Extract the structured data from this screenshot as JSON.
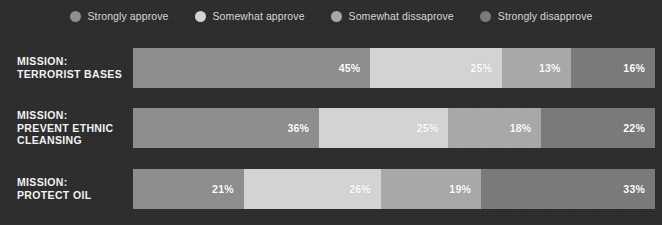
{
  "legend": {
    "items": [
      {
        "label": "Strongly approve",
        "color": "#8e8e8e",
        "icon": "legend-dot-icon"
      },
      {
        "label": "Somewhat approve",
        "color": "#d3d3d3",
        "icon": "legend-dot-icon"
      },
      {
        "label": "Somewhat dissaprove",
        "color": "#a8a8a8",
        "icon": "legend-dot-icon"
      },
      {
        "label": "Strongly disapprove",
        "color": "#7a7a7a",
        "icon": "legend-dot-icon"
      }
    ]
  },
  "rows": [
    {
      "label_lines": [
        "MISSION:",
        "TERRORIST BASES"
      ],
      "segments": [
        {
          "value": "45%",
          "pct": 45,
          "color": "#8e8e8e"
        },
        {
          "value": "25%",
          "pct": 25,
          "color": "#d3d3d3"
        },
        {
          "value": "13%",
          "pct": 13,
          "color": "#a8a8a8"
        },
        {
          "value": "16%",
          "pct": 16,
          "color": "#7a7a7a"
        }
      ]
    },
    {
      "label_lines": [
        "MISSION:",
        "PREVENT ETHNIC",
        "CLEANSING"
      ],
      "segments": [
        {
          "value": "36%",
          "pct": 36,
          "color": "#8e8e8e"
        },
        {
          "value": "25%",
          "pct": 25,
          "color": "#d3d3d3"
        },
        {
          "value": "18%",
          "pct": 18,
          "color": "#a8a8a8"
        },
        {
          "value": "22%",
          "pct": 22,
          "color": "#7a7a7a"
        }
      ]
    },
    {
      "label_lines": [
        "MISSION:",
        "PROTECT OIL"
      ],
      "segments": [
        {
          "value": "21%",
          "pct": 21,
          "color": "#8e8e8e"
        },
        {
          "value": "26%",
          "pct": 26,
          "color": "#d3d3d3"
        },
        {
          "value": "19%",
          "pct": 19,
          "color": "#a8a8a8"
        },
        {
          "value": "33%",
          "pct": 33,
          "color": "#7a7a7a"
        }
      ]
    }
  ],
  "theme": {
    "background": "#2c2c2c",
    "label_color": "#f2f2f2",
    "legend_text_color": "#d6d6d6",
    "value_color": "#ffffff"
  },
  "chart_data": {
    "type": "bar",
    "title": "",
    "subtitle": "",
    "xlabel": "",
    "ylabel": "",
    "orientation": "horizontal",
    "stacked": true,
    "normalized_100pct": true,
    "grid": false,
    "legend_position": "top-center",
    "xlim": [
      0,
      100
    ],
    "categories": [
      "MISSION: TERRORIST BASES",
      "MISSION: PREVENT ETHNIC CLEANSING",
      "MISSION: PROTECT OIL"
    ],
    "series": [
      {
        "name": "Strongly approve",
        "color": "#8e8e8e",
        "values": [
          45,
          36,
          21
        ]
      },
      {
        "name": "Somewhat approve",
        "color": "#d3d3d3",
        "values": [
          25,
          25,
          26
        ]
      },
      {
        "name": "Somewhat dissaprove",
        "color": "#a8a8a8",
        "values": [
          13,
          18,
          19
        ]
      },
      {
        "name": "Strongly disapprove",
        "color": "#7a7a7a",
        "values": [
          16,
          22,
          33
        ]
      }
    ],
    "data_labels": [
      [
        "45%",
        "25%",
        "13%",
        "16%"
      ],
      [
        "36%",
        "25%",
        "18%",
        "22%"
      ],
      [
        "21%",
        "26%",
        "19%",
        "33%"
      ]
    ],
    "annotations": []
  }
}
